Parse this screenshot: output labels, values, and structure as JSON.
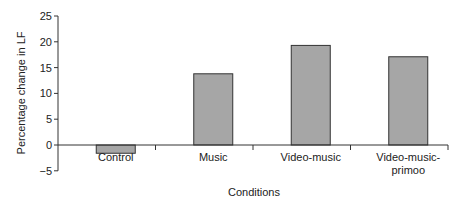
{
  "chart_data": {
    "type": "bar",
    "title": "",
    "xlabel": "Conditions",
    "ylabel": "Percentage change in LF",
    "categories": [
      "Control",
      "Music",
      "Video-music",
      "Video-music-primoo"
    ],
    "category_lines": [
      [
        "Control"
      ],
      [
        "Music"
      ],
      [
        "Video-music"
      ],
      [
        "Video-music-",
        "primoo"
      ]
    ],
    "values": [
      -1.6,
      13.8,
      19.3,
      17.1
    ],
    "ylim": [
      -5,
      25
    ],
    "yticks": [
      25,
      20,
      15,
      10,
      5,
      0,
      -5
    ],
    "ytick_labels": [
      "25",
      "20",
      "15",
      "10",
      "5",
      "0",
      "−5"
    ],
    "grid": false,
    "legend": null,
    "bar_color": "#a6a6a6",
    "bar_edge_color": "#333333"
  }
}
